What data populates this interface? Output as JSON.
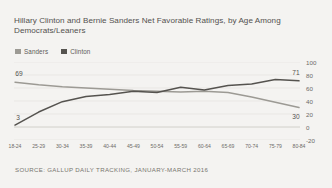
{
  "title": "Hillary Clinton and Bernie Sanders Net Favorable Ratings, by Age Among Democrats/Leaners",
  "source": "SOURCE: GALLUP DAILY TRACKING, JANUARY-MARCH 2016",
  "legend": {
    "items": [
      {
        "label": "Sanders",
        "color": "#9c9a94"
      },
      {
        "label": "Clinton",
        "color": "#55534f"
      }
    ]
  },
  "colors": {
    "background": "#f4f3f1",
    "grid": "#e2e0dc",
    "zero_line": "#c9c7c2",
    "text": "#6d6b68",
    "sanders": "#9c9a94",
    "clinton": "#55534f"
  },
  "chart_data": {
    "type": "line",
    "title": "Hillary Clinton and Bernie Sanders Net Favorable Ratings, by Age Among Democrats/Leaners",
    "xlabel": "",
    "ylabel": "",
    "ylim": [
      -20,
      100
    ],
    "yticks": [
      100,
      80,
      60,
      40,
      20,
      0,
      -20
    ],
    "grid": true,
    "legend_position": "top-left",
    "categories": [
      "18-24",
      "25-29",
      "30-34",
      "35-39",
      "40-44",
      "45-49",
      "50-54",
      "55-59",
      "60-64",
      "65-69",
      "70-74",
      "75-79",
      "80-84"
    ],
    "series": [
      {
        "name": "Sanders",
        "color": "#9c9a94",
        "values": [
          69,
          65,
          62,
          60,
          58,
          56,
          55,
          54,
          55,
          53,
          46,
          38,
          30
        ],
        "start_label": "69",
        "end_label": "30"
      },
      {
        "name": "Clinton",
        "color": "#55534f",
        "values": [
          3,
          23,
          39,
          47,
          50,
          55,
          53,
          61,
          57,
          64,
          66,
          73,
          71
        ],
        "start_label": "3",
        "end_label": "71"
      }
    ],
    "annotations": [
      {
        "text": "69",
        "series": "Sanders",
        "at": "18-24"
      },
      {
        "text": "3",
        "series": "Clinton",
        "at": "18-24"
      },
      {
        "text": "71",
        "series": "Clinton",
        "at": "80-84"
      },
      {
        "text": "30",
        "series": "Sanders",
        "at": "80-84"
      }
    ]
  }
}
